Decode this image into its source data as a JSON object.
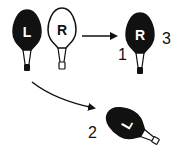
{
  "diagram": {
    "colors": {
      "ink": "#111111",
      "paper": "#ffffff"
    },
    "bulbs": [
      {
        "id": "bulb-L",
        "letter": "L",
        "fill": "black",
        "rotation": 0
      },
      {
        "id": "bulb-R",
        "letter": "R",
        "fill": "white",
        "rotation": 0
      },
      {
        "id": "bulb-1-3",
        "letter": "R",
        "fill": "black",
        "rotation": 0
      },
      {
        "id": "bulb-2",
        "letter": "L",
        "fill": "black",
        "rotation": -60
      }
    ],
    "labels": {
      "one": "1",
      "two": "2",
      "three": "3"
    },
    "arrows": [
      {
        "from": "bulb-R",
        "to": "bulb-1-3",
        "style": "straight"
      },
      {
        "from": "bulb-L",
        "to": "bulb-2",
        "style": "curved"
      }
    ]
  }
}
